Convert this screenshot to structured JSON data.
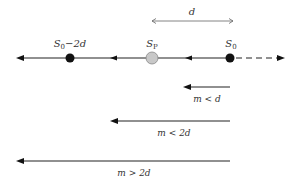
{
  "diagram": {
    "distance_label": "d",
    "points": [
      {
        "id": "s0_minus_2d",
        "base": "S",
        "sub": "0",
        "suffix": "−2d"
      },
      {
        "id": "sp",
        "base": "S",
        "sub": "P",
        "suffix": ""
      },
      {
        "id": "s0",
        "base": "S",
        "sub": "0",
        "suffix": ""
      }
    ],
    "arrows": [
      {
        "id": "m_lt_d",
        "label": "m < d"
      },
      {
        "id": "m_lt_2d",
        "label": "m < 2d"
      },
      {
        "id": "m_gt_2d",
        "label": "m > 2d"
      }
    ],
    "colors": {
      "line": "#222222",
      "dot": "#111111",
      "sp_fill": "#c8c8c8",
      "sp_stroke": "#888888",
      "dim_line": "#666666"
    }
  }
}
